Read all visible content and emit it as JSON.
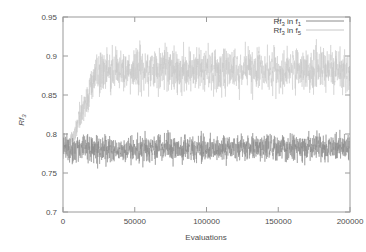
{
  "chart_data": {
    "type": "line",
    "title": "",
    "xlabel": "Evaluations",
    "ylabel": "Rf_3",
    "ylabel_base": "Rf",
    "ylabel_sub": "3",
    "xlim": [
      0,
      200000
    ],
    "ylim": [
      0.7,
      0.95
    ],
    "grid": false,
    "legend_position": "top-right",
    "xticks": [
      0,
      50000,
      100000,
      150000,
      200000
    ],
    "xtick_labels": [
      "0",
      "50000",
      "100000",
      "150000",
      "200000"
    ],
    "yticks": [
      0.7,
      0.75,
      0.8,
      0.85,
      0.9,
      0.95
    ],
    "ytick_labels": [
      "0.7",
      "0.75",
      "0.8",
      "0.85",
      "0.9",
      "0.95"
    ],
    "series": [
      {
        "name": "Rf_3 in f_1",
        "label_base": "Rf",
        "label_sub1": "3",
        "label_mid": " in f",
        "label_sub2": "1",
        "color": "#8c8c8c",
        "mean_start": 0.78,
        "mean_end": 0.783,
        "noise_amplitude": 0.026,
        "band_low": 0.752,
        "band_high": 0.808,
        "description": "Dense high-frequency noise band, flat across all evaluations, centered near 0.78"
      },
      {
        "name": "Rf_3 in f_5",
        "label_base": "Rf",
        "label_sub1": "3",
        "label_mid": " in f",
        "label_sub2": "5",
        "color": "#c8c8c8",
        "mean_start": 0.782,
        "rise_end_x": 28000,
        "mean_plateau": 0.882,
        "noise_amplitude": 0.042,
        "band_low": 0.838,
        "band_high": 0.932,
        "description": "Starts near 0.78, rises steeply until ~28000 evaluations, then noisy plateau near 0.88"
      }
    ]
  },
  "axes": {
    "x_title": "Evaluations",
    "y_title_base": "Rf",
    "y_title_sub": "3"
  },
  "colors": {
    "frame": "#9a9a9a",
    "text": "#4d4d4d",
    "series1": "#8c8c8c",
    "series2": "#c8c8c8",
    "background": "#ffffff"
  }
}
